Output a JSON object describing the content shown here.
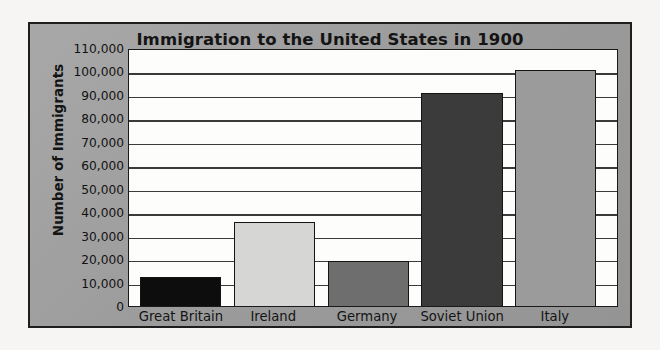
{
  "chart_data": {
    "type": "bar",
    "title": "Immigration to the United States in 1900",
    "xlabel": "",
    "ylabel": "Number of Immigrants",
    "categories": [
      "Great Britain",
      "Ireland",
      "Germany",
      "Soviet Union",
      "Italy"
    ],
    "values": [
      12500,
      36000,
      19000,
      91000,
      100500
    ],
    "ylim": [
      0,
      110000
    ],
    "ytick_step": 10000,
    "ytick_labels": [
      "110,000",
      "100,000",
      "90,000",
      "80,000",
      "70,000",
      "60,000",
      "50,000",
      "40,000",
      "30,000",
      "20,000",
      "10,000",
      "0"
    ],
    "ytick_values": [
      110000,
      100000,
      90000,
      80000,
      70000,
      60000,
      50000,
      40000,
      30000,
      20000,
      10000,
      0
    ],
    "bar_colors": [
      "#0d0d0d",
      "#d6d6d4",
      "#6e6e6e",
      "#3b3b3b",
      "#9b9b9b"
    ],
    "bar_edge_color": "#141414",
    "grid": true,
    "grid_axis": "y",
    "legend": false,
    "legend_position": "none",
    "plot_background": "#fdfdfb",
    "panel_background": "#9e9e9e",
    "frame_border_color": "#1e1e1e",
    "text_color": "#141414"
  }
}
